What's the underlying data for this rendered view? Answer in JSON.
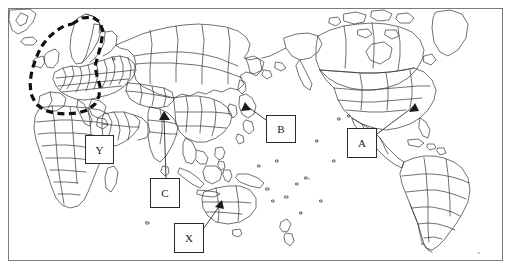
{
  "figure": {
    "type": "world-map-outline",
    "background_color": "#ffffff",
    "coastline_color": "#333333",
    "frame_color": "#7a7a7a",
    "annotation_color": "#2b2b2b"
  },
  "highlight_region": {
    "name": "europe-dashed-outline",
    "style": "thick black dashed closed loop",
    "color": "#111111",
    "encircles": "Europe"
  },
  "labels": [
    {
      "id": "A",
      "text": "A",
      "has_arrow": true,
      "points_to": "western United States"
    },
    {
      "id": "B",
      "text": "B",
      "has_arrow": true,
      "points_to": "Japan"
    },
    {
      "id": "C",
      "text": "C",
      "has_arrow": true,
      "points_to": "southern China / Southeast Asia"
    },
    {
      "id": "X",
      "text": "X",
      "has_arrow": true,
      "points_to": "southern Australia"
    },
    {
      "id": "Y",
      "text": "Y",
      "has_arrow": false,
      "points_to": "northeastern Africa"
    }
  ]
}
